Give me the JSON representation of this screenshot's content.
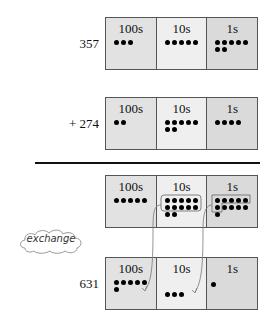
{
  "rows": [
    {
      "number": "357",
      "hundreds": 3,
      "tens": 5,
      "ones": 7
    },
    {
      "number": "+ 274",
      "hundreds": 2,
      "tens": 7,
      "ones": 4
    },
    {
      "number": "",
      "hundreds": 5,
      "tens": 12,
      "ones": 11
    },
    {
      "number": "631",
      "hundreds": 6,
      "tens": 3,
      "ones": 1
    }
  ],
  "labels": {
    "hundreds": "100s",
    "tens": "10s",
    "ones": "1s"
  },
  "cloud_label": "exchange",
  "colors": {
    "hundreds_bg": "#e2e2e2",
    "tens_bg": "#efefef",
    "ones_bg": "#dadada",
    "dot": "#000000"
  }
}
